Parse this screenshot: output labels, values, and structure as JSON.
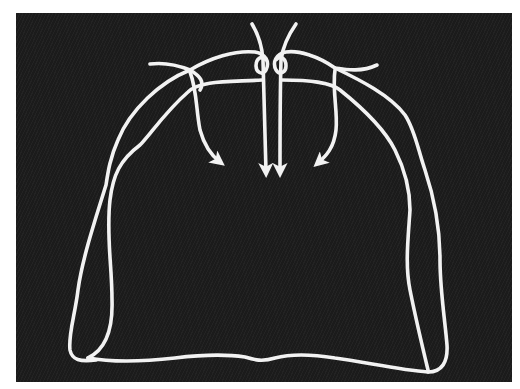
{
  "figure": {
    "type": "schematic line drawing",
    "colors": {
      "background": "#1b1b1b",
      "margin": "#ffffff",
      "line": "#f2f2f2"
    },
    "elements": {
      "outer_contour": "outer-contour",
      "inner_contour_left": "inner-contour-left",
      "inner_contour_right": "inner-contour-right",
      "bottom_edge": "bottom-edge",
      "arrows": [
        {
          "id": "arrow-left-lateral",
          "direction": "down-right"
        },
        {
          "id": "arrow-center-left",
          "direction": "down"
        },
        {
          "id": "arrow-center-right",
          "direction": "down"
        },
        {
          "id": "arrow-right-lateral",
          "direction": "down-left"
        }
      ]
    }
  }
}
